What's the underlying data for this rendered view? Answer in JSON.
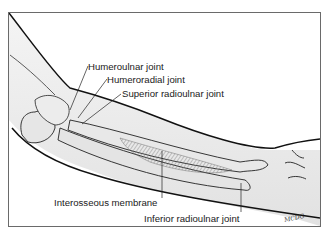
{
  "figure": {
    "labels": [
      {
        "id": "humeroulnar",
        "text": "Humeroulnar joint"
      },
      {
        "id": "humeroradial",
        "text": "Humeroradial joint"
      },
      {
        "id": "superior_radioulnar",
        "text": "Superior radioulnar joint"
      },
      {
        "id": "interosseous",
        "text": "Interosseous membrane"
      },
      {
        "id": "inferior_radioulnar",
        "text": "Inferior radioulnar joint"
      }
    ],
    "signature": "MCDG"
  }
}
